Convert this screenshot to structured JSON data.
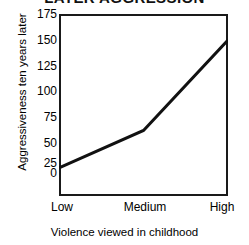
{
  "chart_data": {
    "type": "line",
    "title": "LATER AGGRESSION",
    "xlabel": "Violence viewed in childhood",
    "ylabel": "Aggressiveness ten years later",
    "categories": [
      "Low",
      "Medium",
      "High"
    ],
    "values": [
      27,
      63,
      150
    ],
    "series": [
      {
        "name": "Aggressiveness ten years later",
        "values": [
          27,
          63,
          150
        ]
      }
    ],
    "yticks": [
      175,
      150,
      125,
      100,
      75,
      50,
      25,
      0
    ],
    "ytick_labels": [
      "175",
      "150",
      "125",
      "100",
      "75",
      "50",
      "25",
      "0"
    ],
    "ylim": [
      0,
      175
    ],
    "grid": false,
    "legend": false,
    "legend_position": "none",
    "line_color": "#111111",
    "background_color": "#ffffff",
    "axis_color": "#1a1a1a"
  }
}
